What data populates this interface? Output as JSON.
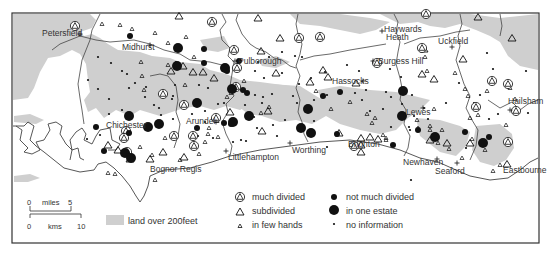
{
  "map": {
    "frame": {
      "x": 12,
      "y": 13,
      "w": 527,
      "h": 230
    },
    "colors": {
      "high_land": "#cfcfcf",
      "sea": "#ffffff",
      "coast": "#444444",
      "boundary": "#444444",
      "symbol": "#111111",
      "text": "#333333"
    },
    "places": [
      {
        "name": "Petersfield",
        "x": 42,
        "y": 36,
        "marker": "+",
        "mx": 80,
        "my": 34
      },
      {
        "name": "Midhurst",
        "x": 122,
        "y": 50,
        "marker": "+",
        "mx": 150,
        "my": 45
      },
      {
        "name": "Pulborough",
        "x": 238,
        "y": 64,
        "marker": "+",
        "mx": 235,
        "my": 61
      },
      {
        "name": "Haywards",
        "x": 384,
        "y": 32,
        "marker": "+",
        "mx": 382,
        "my": 31
      },
      {
        "name": "Heath",
        "x": 386,
        "y": 40,
        "marker": "",
        "mx": 0,
        "my": 0
      },
      {
        "name": "Uckfield",
        "x": 438,
        "y": 44,
        "marker": "+",
        "mx": 452,
        "my": 47
      },
      {
        "name": "Burgess Hill",
        "x": 378,
        "y": 64,
        "marker": "+",
        "mx": 373,
        "my": 61
      },
      {
        "name": "Hassocks",
        "x": 332,
        "y": 84,
        "marker": "+",
        "mx": 363,
        "my": 81
      },
      {
        "name": "Lewes",
        "x": 406,
        "y": 115,
        "marker": "+",
        "mx": 423,
        "my": 108
      },
      {
        "name": "Hailsham",
        "x": 508,
        "y": 104,
        "marker": "+",
        "mx": 510,
        "my": 110
      },
      {
        "name": "Chichester",
        "x": 106,
        "y": 128,
        "marker": "",
        "mx": 0,
        "my": 0
      },
      {
        "name": "Arundel",
        "x": 186,
        "y": 124,
        "marker": "+",
        "mx": 216,
        "my": 122
      },
      {
        "name": "Littlehampton",
        "x": 228,
        "y": 160,
        "marker": "+",
        "mx": 226,
        "my": 151
      },
      {
        "name": "Worthing",
        "x": 292,
        "y": 153,
        "marker": "+",
        "mx": 290,
        "my": 143
      },
      {
        "name": "Brighton",
        "x": 348,
        "y": 147,
        "marker": "",
        "mx": 0,
        "my": 0
      },
      {
        "name": "Bognor Regis",
        "x": 150,
        "y": 172,
        "marker": "",
        "mx": 0,
        "my": 0
      },
      {
        "name": "Newhaven",
        "x": 403,
        "y": 165,
        "marker": "+",
        "mx": 437,
        "my": 159
      },
      {
        "name": "Seaford",
        "x": 435,
        "y": 174,
        "marker": "+",
        "mx": 457,
        "my": 163
      },
      {
        "name": "Eastbourne",
        "x": 503,
        "y": 173,
        "marker": "",
        "mx": 0,
        "my": 0
      }
    ],
    "symbols": {
      "much_divided": [
        [
          75,
          26
        ],
        [
          212,
          22
        ],
        [
          234,
          50
        ],
        [
          237,
          68
        ],
        [
          236,
          87
        ],
        [
          299,
          38
        ],
        [
          320,
          37
        ],
        [
          377,
          63
        ],
        [
          354,
          146
        ],
        [
          126,
          131
        ],
        [
          163,
          94
        ],
        [
          174,
          136
        ],
        [
          184,
          105
        ],
        [
          194,
          146
        ],
        [
          193,
          136
        ],
        [
          216,
          118
        ],
        [
          426,
          14
        ],
        [
          422,
          48
        ],
        [
          492,
          81
        ],
        [
          508,
          84
        ],
        [
          476,
          107
        ],
        [
          516,
          111
        ],
        [
          508,
          142
        ],
        [
          124,
          138
        ],
        [
          127,
          152
        ]
      ],
      "subdivided": [
        [
          179,
          16
        ],
        [
          258,
          18
        ],
        [
          280,
          38
        ],
        [
          261,
          51
        ],
        [
          276,
          73
        ],
        [
          203,
          72
        ],
        [
          183,
          66
        ],
        [
          193,
          72
        ],
        [
          171,
          71
        ],
        [
          214,
          78
        ],
        [
          323,
          70
        ],
        [
          328,
          77
        ],
        [
          310,
          82
        ],
        [
          356,
          83
        ],
        [
          422,
          74
        ],
        [
          424,
          49
        ],
        [
          434,
          79
        ],
        [
          478,
          17
        ],
        [
          512,
          38
        ],
        [
          463,
          59
        ],
        [
          230,
          112
        ],
        [
          268,
          111
        ],
        [
          339,
          133
        ],
        [
          361,
          138
        ],
        [
          361,
          145
        ],
        [
          361,
          152
        ],
        [
          370,
          137
        ],
        [
          378,
          139
        ],
        [
          130,
          159
        ],
        [
          118,
          150
        ],
        [
          163,
          152
        ],
        [
          184,
          157
        ],
        [
          150,
          159
        ],
        [
          108,
          145
        ],
        [
          430,
          140
        ],
        [
          470,
          143
        ],
        [
          447,
          143
        ],
        [
          507,
          164
        ],
        [
          262,
          131
        ]
      ],
      "few_hands": [
        [
          102,
          24
        ],
        [
          120,
          25
        ],
        [
          132,
          29
        ],
        [
          155,
          33
        ],
        [
          186,
          37
        ],
        [
          185,
          85
        ],
        [
          141,
          62
        ],
        [
          142,
          76
        ],
        [
          144,
          90
        ],
        [
          168,
          65
        ],
        [
          168,
          43
        ],
        [
          194,
          57
        ],
        [
          227,
          97
        ],
        [
          269,
          107
        ],
        [
          244,
          81
        ],
        [
          261,
          113
        ],
        [
          231,
          93
        ],
        [
          217,
          121
        ],
        [
          316,
          91
        ],
        [
          331,
          109
        ],
        [
          375,
          118
        ],
        [
          372,
          123
        ],
        [
          350,
          102
        ],
        [
          367,
          114
        ],
        [
          386,
          138
        ],
        [
          418,
          128
        ],
        [
          430,
          126
        ],
        [
          434,
          109
        ],
        [
          417,
          120
        ],
        [
          383,
          135
        ],
        [
          386,
          140
        ],
        [
          442,
          130
        ],
        [
          437,
          137
        ],
        [
          438,
          143
        ],
        [
          430,
          130
        ],
        [
          449,
          149
        ],
        [
          462,
          158
        ],
        [
          470,
          118
        ],
        [
          478,
          115
        ],
        [
          485,
          150
        ],
        [
          493,
          171
        ],
        [
          500,
          165
        ],
        [
          472,
          139
        ],
        [
          425,
          57
        ],
        [
          427,
          71
        ],
        [
          465,
          89
        ],
        [
          468,
          96
        ],
        [
          487,
          91
        ],
        [
          515,
          99
        ],
        [
          510,
          88
        ],
        [
          455,
          73
        ],
        [
          506,
          125
        ],
        [
          108,
          173
        ],
        [
          115,
          174
        ],
        [
          155,
          180
        ],
        [
          140,
          147
        ],
        [
          152,
          155
        ],
        [
          165,
          138
        ],
        [
          180,
          160
        ],
        [
          209,
          128
        ],
        [
          208,
          134
        ],
        [
          199,
          154
        ],
        [
          218,
          137
        ],
        [
          205,
          142
        ]
      ],
      "not_much_divided": [
        [
          130,
          36
        ],
        [
          204,
          49
        ],
        [
          204,
          63
        ],
        [
          227,
          71
        ],
        [
          243,
          90
        ],
        [
          247,
          93
        ],
        [
          239,
          61
        ],
        [
          323,
          96
        ],
        [
          340,
          92
        ],
        [
          337,
          134
        ],
        [
          393,
          145
        ],
        [
          418,
          130
        ],
        [
          489,
          137
        ],
        [
          465,
          132
        ],
        [
          104,
          151
        ],
        [
          96,
          127
        ],
        [
          129,
          133
        ],
        [
          224,
          123
        ],
        [
          231,
          124
        ],
        [
          197,
          128
        ]
      ],
      "one_estate": [
        [
          178,
          48
        ],
        [
          177,
          66
        ],
        [
          225,
          68
        ],
        [
          232,
          89
        ],
        [
          197,
          103
        ],
        [
          233,
          122
        ],
        [
          308,
          109
        ],
        [
          301,
          128
        ],
        [
          311,
          133
        ],
        [
          129,
          116
        ],
        [
          125,
          153
        ],
        [
          159,
          124
        ],
        [
          148,
          127
        ],
        [
          249,
          116
        ],
        [
          403,
          91
        ],
        [
          402,
          116
        ],
        [
          435,
          137
        ],
        [
          483,
          143
        ],
        [
          131,
          158
        ]
      ],
      "no_information": [
        [
          98,
          57
        ],
        [
          111,
          63
        ],
        [
          122,
          71
        ],
        [
          127,
          74
        ],
        [
          135,
          83
        ],
        [
          88,
          80
        ],
        [
          98,
          89
        ],
        [
          129,
          88
        ],
        [
          146,
          87
        ],
        [
          109,
          99
        ],
        [
          145,
          97
        ],
        [
          109,
          114
        ],
        [
          154,
          105
        ],
        [
          122,
          110
        ],
        [
          173,
          96
        ],
        [
          159,
          108
        ],
        [
          161,
          115
        ],
        [
          172,
          99
        ],
        [
          173,
          119
        ],
        [
          205,
          111
        ],
        [
          212,
          119
        ],
        [
          224,
          103
        ],
        [
          218,
          104
        ],
        [
          176,
          62
        ],
        [
          175,
          85
        ],
        [
          199,
          85
        ],
        [
          208,
          88
        ],
        [
          258,
          62
        ],
        [
          264,
          78
        ],
        [
          255,
          71
        ],
        [
          282,
          73
        ],
        [
          263,
          97
        ],
        [
          255,
          95
        ],
        [
          311,
          78
        ],
        [
          282,
          52
        ],
        [
          269,
          57
        ],
        [
          295,
          56
        ],
        [
          302,
          57
        ],
        [
          325,
          72
        ],
        [
          327,
          95
        ],
        [
          347,
          65
        ],
        [
          359,
          71
        ],
        [
          370,
          111
        ],
        [
          327,
          147
        ],
        [
          362,
          100
        ],
        [
          391,
          97
        ],
        [
          402,
          104
        ],
        [
          410,
          130
        ],
        [
          424,
          108
        ],
        [
          446,
          103
        ],
        [
          459,
          83
        ],
        [
          480,
          95
        ],
        [
          493,
          69
        ],
        [
          526,
          71
        ],
        [
          487,
          53
        ],
        [
          528,
          113
        ],
        [
          412,
          95
        ],
        [
          401,
          77
        ],
        [
          409,
          127
        ],
        [
          383,
          109
        ],
        [
          391,
          127
        ],
        [
          428,
          119
        ],
        [
          355,
          93
        ],
        [
          386,
          92
        ],
        [
          414,
          116
        ],
        [
          474,
          103
        ],
        [
          489,
          119
        ],
        [
          498,
          114
        ],
        [
          466,
          148
        ],
        [
          411,
          180
        ],
        [
          100,
          135
        ],
        [
          87,
          139
        ],
        [
          213,
          138
        ],
        [
          246,
          141
        ],
        [
          257,
          128
        ],
        [
          254,
          117
        ],
        [
          205,
          122
        ],
        [
          198,
          136
        ],
        [
          192,
          114
        ],
        [
          272,
          94
        ],
        [
          262,
          103
        ],
        [
          245,
          105
        ],
        [
          233,
          142
        ],
        [
          241,
          140
        ],
        [
          299,
          84
        ],
        [
          366,
          90
        ],
        [
          390,
          69
        ],
        [
          314,
          121
        ],
        [
          314,
          100
        ],
        [
          297,
          103
        ],
        [
          293,
          96
        ],
        [
          285,
          120
        ],
        [
          273,
          125
        ],
        [
          277,
          136
        ]
      ]
    },
    "legend": {
      "items_left": [
        {
          "symbol": "much_divided",
          "label": "much divided"
        },
        {
          "symbol": "subdivided",
          "label": "subdivided"
        },
        {
          "symbol": "few_hands",
          "label": "in few hands"
        }
      ],
      "items_right": [
        {
          "symbol": "not_much_divided",
          "label": "not much divided"
        },
        {
          "symbol": "one_estate",
          "label": "in one estate"
        },
        {
          "symbol": "no_information",
          "label": "no information"
        }
      ],
      "land_swatch_label": "land over 200feet"
    },
    "scale": {
      "miles_start": "0",
      "miles_label": "miles",
      "miles_end": "5",
      "kms_start": "0",
      "kms_label": "kms",
      "kms_end": "10"
    }
  }
}
